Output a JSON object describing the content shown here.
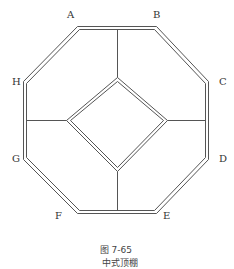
{
  "diagram": {
    "title": "中式顶棚",
    "figure_number": "图 7-65",
    "colors": {
      "line": "#555555",
      "text": "#333333",
      "background": "#ffffff"
    },
    "outer_octagon": {
      "vertices": [
        {
          "label": "A",
          "x": 79,
          "y": 29
        },
        {
          "label": "B",
          "x": 155,
          "y": 29
        },
        {
          "label": "C",
          "x": 206,
          "y": 83
        },
        {
          "label": "D",
          "x": 206,
          "y": 158
        },
        {
          "label": "E",
          "x": 155,
          "y": 211
        },
        {
          "label": "F",
          "x": 79,
          "y": 211
        },
        {
          "label": "G",
          "x": 26,
          "y": 158
        },
        {
          "label": "H",
          "x": 26,
          "y": 83
        }
      ],
      "line_style": "double"
    },
    "inner_diamond": {
      "vertices": [
        {
          "x": 117,
          "y": 79
        },
        {
          "x": 166,
          "y": 120
        },
        {
          "x": 117,
          "y": 170
        },
        {
          "x": 68,
          "y": 120
        }
      ],
      "line_style": "double"
    },
    "connectors": [
      {
        "from": "top edge",
        "to": "diamond top"
      },
      {
        "from": "diamond bottom",
        "to": "bottom edge"
      },
      {
        "from": "left edge",
        "to": "diamond left"
      },
      {
        "from": "diamond right",
        "to": "right edge"
      }
    ],
    "labels": {
      "A": "A",
      "B": "B",
      "C": "C",
      "D": "D",
      "E": "E",
      "F": "F",
      "G": "G",
      "H": "H"
    }
  }
}
